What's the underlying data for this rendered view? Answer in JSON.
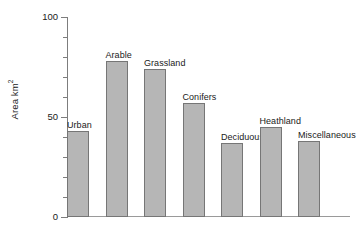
{
  "chart_data": {
    "type": "bar",
    "title": "",
    "xlabel": "",
    "ylabel": "Area km²",
    "ylabel_base": "Area km",
    "ylabel_sup": "2",
    "ylim": [
      0,
      100
    ],
    "yticks": [
      0,
      50,
      100
    ],
    "ytick_labels": [
      "0",
      "50",
      "100"
    ],
    "yminor_step": 10,
    "grid": false,
    "legend": null,
    "categories": [
      "Urban",
      "Arable",
      "Grassland",
      "Conifers",
      "Deciduous",
      "Heathland",
      "Miscellaneous"
    ],
    "values": [
      43,
      78,
      74,
      57,
      37,
      45,
      38
    ],
    "labels_above_bars": true,
    "bar_fill": "#b6b6b6",
    "bar_border": "#767676",
    "axis_color": "#7d7d7d",
    "text_color": "#1a1a1a",
    "background": "#ffffff"
  },
  "bars": [
    {
      "label": "Urban",
      "value": 43
    },
    {
      "label": "Arable",
      "value": 78
    },
    {
      "label": "Grassland",
      "value": 74
    },
    {
      "label": "Conifers",
      "value": 57
    },
    {
      "label": "Deciduous",
      "value": 37
    },
    {
      "label": "Heathland",
      "value": 45
    },
    {
      "label": "Miscellaneous",
      "value": 38
    }
  ],
  "axis": {
    "tick_100": "100",
    "tick_50": "50",
    "tick_0": "0"
  }
}
